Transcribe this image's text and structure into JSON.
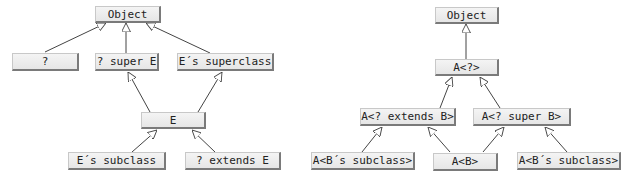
{
  "left_diagram": {
    "nodes": {
      "object": "Object",
      "wildcard": "?",
      "super_e": "? super E",
      "e_superclass": "E´s superclass",
      "e": "E",
      "e_subclass": "E´s subclass",
      "extends_e": "? extends E"
    },
    "edges": [
      [
        "?",
        "Object"
      ],
      [
        "? super E",
        "Object"
      ],
      [
        "E´s superclass",
        "Object"
      ],
      [
        "E",
        "? super E"
      ],
      [
        "E",
        "E´s superclass"
      ],
      [
        "E´s subclass",
        "E"
      ],
      [
        "? extends E",
        "E"
      ]
    ]
  },
  "right_diagram": {
    "nodes": {
      "object": "Object",
      "a_wild": "A<?>",
      "a_extends_b": "A<? extends B>",
      "a_super_b": "A<? super B>",
      "a_b_subclass_left": "A<B´s subclass>",
      "a_b": "A<B>",
      "a_b_subclass_right": "A<B´s subclass>"
    },
    "edges": [
      [
        "A<?>",
        "Object"
      ],
      [
        "A<? extends B>",
        "A<?>"
      ],
      [
        "A<? super B>",
        "A<?>"
      ],
      [
        "A<B´s subclass>",
        "A<? extends B>"
      ],
      [
        "A<B>",
        "A<? extends B>"
      ],
      [
        "A<B>",
        "A<? super B>"
      ],
      [
        "A<B´s subclass>",
        "A<? super B>"
      ]
    ]
  },
  "colors": {
    "box_fill": "#ececec",
    "box_shadow": "#7a7a7a",
    "line": "#444444"
  }
}
